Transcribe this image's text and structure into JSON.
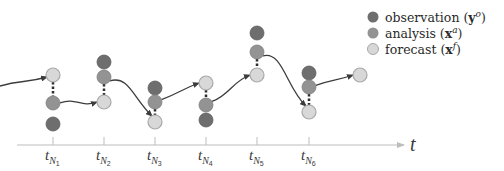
{
  "colors": {
    "observation": "#6e6e6e",
    "analysis": "#939393",
    "forecast": "#d8d8d8",
    "forecast_stroke": "#a8a8a8",
    "curve": "#3c3c3c",
    "axis": "#bdbdbd",
    "connector": "#2e2e2e"
  },
  "legend": {
    "items": [
      {
        "label": "observation",
        "symbol": "y",
        "superscript": "o",
        "kind": "observation"
      },
      {
        "label": "analysis",
        "symbol": "x",
        "superscript": "a",
        "kind": "analysis"
      },
      {
        "label": "forecast",
        "symbol": "x",
        "superscript": "f",
        "kind": "forecast"
      }
    ]
  },
  "axis": {
    "label": "t",
    "ticks": [
      {
        "base": "t",
        "sub": "N",
        "subsub": "1",
        "x": 53
      },
      {
        "base": "t",
        "sub": "N",
        "subsub": "2",
        "x": 104
      },
      {
        "base": "t",
        "sub": "N",
        "subsub": "3",
        "x": 155
      },
      {
        "base": "t",
        "sub": "N",
        "subsub": "4",
        "x": 206
      },
      {
        "base": "t",
        "sub": "N",
        "subsub": "5",
        "x": 257
      },
      {
        "base": "t",
        "sub": "N",
        "subsub": "6",
        "x": 309
      }
    ]
  },
  "time_steps": [
    {
      "x": 53,
      "observation_y": 124,
      "analysis_y": 103,
      "forecast_y": 75
    },
    {
      "x": 104,
      "observation_y": 62,
      "analysis_y": 77,
      "forecast_y": 102
    },
    {
      "x": 155,
      "observation_y": 88,
      "analysis_y": 102,
      "forecast_y": 122
    },
    {
      "x": 206,
      "observation_y": 120,
      "analysis_y": 105,
      "forecast_y": 83
    },
    {
      "x": 257,
      "observation_y": 33,
      "analysis_y": 52,
      "forecast_y": 75
    },
    {
      "x": 309,
      "observation_y": 73,
      "analysis_y": 87,
      "forecast_y": 112
    }
  ],
  "final_forecast": {
    "x": 360,
    "y": 75
  },
  "initial_curve_start": {
    "x": 0,
    "y": 86
  }
}
